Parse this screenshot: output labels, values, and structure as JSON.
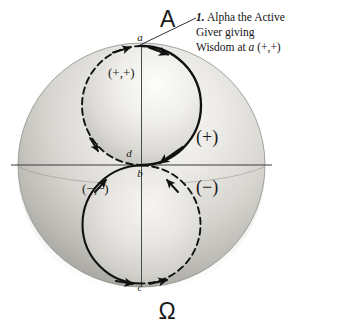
{
  "figure": {
    "type": "diagram",
    "poles": {
      "top_symbol": "A",
      "top_symbol_name": "Alpha",
      "bottom_symbol": "Ω",
      "bottom_symbol_name": "Omega"
    },
    "points": [
      {
        "id": "a",
        "label": "a",
        "position": "top-pole"
      },
      {
        "id": "d",
        "label": "d",
        "position": "center-above-equator"
      },
      {
        "id": "b",
        "label": "b",
        "position": "center-below-equator"
      },
      {
        "id": "c",
        "label": "c",
        "position": "bottom-pole"
      }
    ],
    "polarity_labels": [
      {
        "id": "upper-pair",
        "text": "(+,+)"
      },
      {
        "id": "lower-pair",
        "text": "(−,−)"
      },
      {
        "id": "upper-hemisphere",
        "text": "(+)"
      },
      {
        "id": "lower-hemisphere",
        "text": "(−)"
      }
    ],
    "callout": {
      "number": "1.",
      "lines": [
        "Alpha the Active",
        "Giver giving",
        "Wisdom at a (+,+)"
      ],
      "italic_token": "a",
      "target_point": "a"
    },
    "colors": {
      "background": "#ffffff",
      "ink": "#1a1a1a",
      "sphere_light": "#f2f1ee",
      "sphere_mid": "#c9c7c2",
      "sphere_dark": "#9c9a95",
      "sphere_edge": "#8e8c87"
    }
  }
}
